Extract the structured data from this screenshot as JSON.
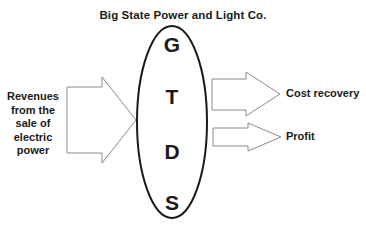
{
  "title": "Big State Power and Light Co.",
  "input": {
    "lines": [
      "Revenues",
      "from the",
      "sale of",
      "electric",
      "power"
    ]
  },
  "process": {
    "letters": [
      "G",
      "T",
      "D",
      "S"
    ]
  },
  "outputs": [
    {
      "label": "Cost recovery"
    },
    {
      "label": "Profit"
    }
  ],
  "colors": {
    "stroke_arrow": "#8a8a8a",
    "stroke_ellipse": "#1a1a1a",
    "text": "#1a1a1a"
  }
}
